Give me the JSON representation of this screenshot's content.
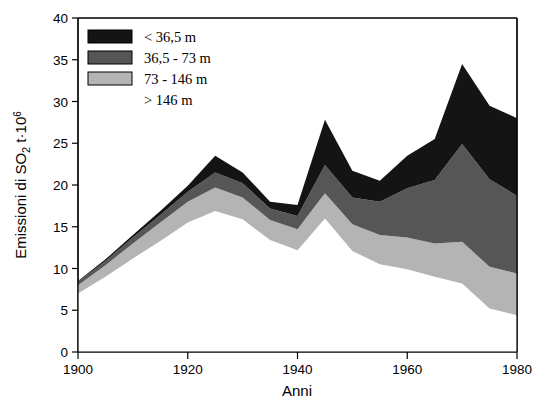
{
  "chart_data": {
    "type": "area",
    "stacked": true,
    "title": "",
    "xlabel": "Anni",
    "ylabel": "Emissioni di SO2 t·10⁶",
    "ylabel_parts": {
      "main": "Emissioni di SO",
      "sub": "2",
      "mid": " t·10",
      "sup": "6"
    },
    "x": [
      1900,
      1905,
      1910,
      1915,
      1920,
      1925,
      1930,
      1935,
      1940,
      1945,
      1950,
      1955,
      1960,
      1965,
      1970,
      1975,
      1980
    ],
    "xlim": [
      1900,
      1980
    ],
    "ylim": [
      0,
      40
    ],
    "xticks": [
      1900,
      1920,
      1940,
      1960,
      1980
    ],
    "yticks": [
      0,
      5,
      10,
      15,
      20,
      25,
      30,
      35,
      40
    ],
    "grid": false,
    "legend_position": "top-left",
    "series": [
      {
        "name": "> 146 m",
        "key": "gt146",
        "color": "#ffffff",
        "legend_swatch_visible": false,
        "values": [
          7.0,
          9.0,
          11.2,
          13.3,
          15.5,
          16.9,
          15.9,
          13.4,
          12.2,
          16.0,
          12.1,
          10.5,
          9.9,
          9.0,
          8.2,
          5.2,
          4.4
        ]
      },
      {
        "name": "73 - 146 m",
        "key": "s73_146",
        "color": "#b4b4b4",
        "legend_swatch_visible": true,
        "values": [
          1.0,
          1.4,
          1.8,
          2.2,
          2.5,
          2.8,
          2.6,
          2.4,
          2.5,
          3.0,
          3.2,
          3.5,
          3.8,
          4.0,
          5.0,
          5.0,
          5.0
        ]
      },
      {
        "name": "36,5 - 73 m",
        "key": "s365_73",
        "color": "#565656",
        "legend_swatch_visible": true,
        "values": [
          0.4,
          0.5,
          0.7,
          0.9,
          1.2,
          1.8,
          1.7,
          1.4,
          1.6,
          3.4,
          3.2,
          4.0,
          5.9,
          7.6,
          11.7,
          10.5,
          9.3
        ]
      },
      {
        "name": "< 36,5 m",
        "key": "lt365",
        "color": "#141414",
        "legend_swatch_visible": true,
        "values": [
          0.1,
          0.2,
          0.3,
          0.5,
          0.7,
          2.0,
          1.3,
          0.8,
          1.3,
          5.4,
          3.2,
          2.5,
          3.9,
          4.9,
          9.6,
          8.8,
          9.3
        ]
      }
    ],
    "totals": [
      8.5,
      11.1,
      14.0,
      16.9,
      19.9,
      23.5,
      21.5,
      18.0,
      17.6,
      27.8,
      21.7,
      20.5,
      23.5,
      25.5,
      34.5,
      29.5,
      28.0
    ]
  },
  "legend": {
    "items": [
      {
        "label": "< 36,5 m",
        "color": "#141414",
        "swatch": true
      },
      {
        "label": "36,5 - 73 m",
        "color": "#565656",
        "swatch": true
      },
      {
        "label": "73 - 146 m",
        "color": "#b4b4b4",
        "swatch": true
      },
      {
        "label": "> 146 m",
        "color": "#ffffff",
        "swatch": false
      }
    ]
  },
  "axes": {
    "x_title": "Anni",
    "y_tick_labels": [
      "0",
      "5",
      "10",
      "15",
      "20",
      "25",
      "30",
      "35",
      "40"
    ],
    "x_tick_labels": [
      "1900",
      "1920",
      "1940",
      "1960",
      "1980"
    ]
  }
}
